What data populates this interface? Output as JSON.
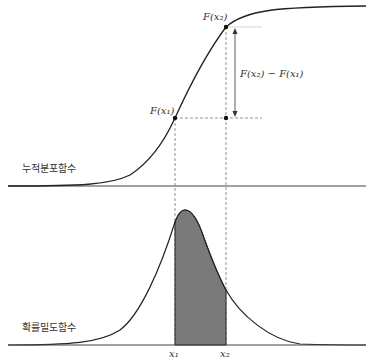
{
  "cdf": {
    "label": "누적분포함수",
    "point_x1_label": "F(x₁)",
    "point_x2_label": "F(x₂)",
    "difference_label": "F(x₂) − F(x₁)"
  },
  "pdf": {
    "label": "확률밀도함수",
    "x1_label": "x₁",
    "x2_label": "x₂"
  },
  "colors": {
    "line": "#222222",
    "shade": "#7a7a7a",
    "dash": "#777777",
    "background": "#ffffff"
  }
}
